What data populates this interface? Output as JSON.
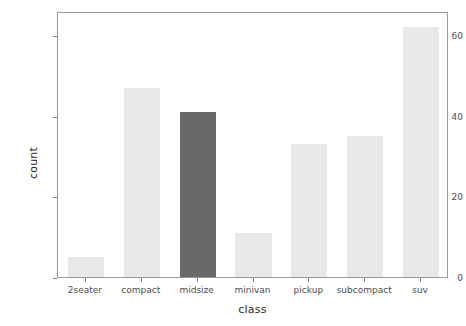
{
  "chart_data": {
    "type": "bar",
    "title": "",
    "subtitle": "",
    "xlabel": "class",
    "ylabel": "count",
    "categories": [
      "2seater",
      "compact",
      "midsize",
      "minivan",
      "pickup",
      "subcompact",
      "suv"
    ],
    "values": [
      5,
      47,
      41,
      11,
      33,
      35,
      62
    ],
    "ylim": [
      0,
      66
    ],
    "yticks": [
      0,
      20,
      40,
      60
    ],
    "ytick_labels": [
      "0",
      "20",
      "40",
      "60"
    ],
    "grid": false,
    "legend": "none",
    "bar_colors": [
      "#e8e8e8",
      "#e8e8e8",
      "#696969",
      "#e8e8e8",
      "#e8e8e8",
      "#e8e8e8",
      "#e8e8e8"
    ],
    "highlight_category": "midsize",
    "default_bar_color": "#e8e8e8",
    "highlight_bar_color": "#696969",
    "panel_border_color": "#9a9a9a",
    "axis_text_color": "#4d4d4d",
    "axis_title_color": "#2b2b2b",
    "background_color": "#ffffff"
  }
}
